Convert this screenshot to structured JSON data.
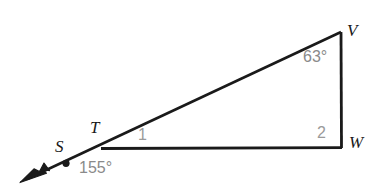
{
  "figure": {
    "type": "geometry-diagram",
    "background_color": "#ffffff",
    "stroke_color": "#1a1a1a",
    "label_color": "#191919",
    "angle_label_color": "#8a8a8a",
    "vertices": [
      {
        "name": "V",
        "label": "V",
        "x": 341,
        "y": 32
      },
      {
        "name": "W",
        "label": "W",
        "x": 341,
        "y": 147
      },
      {
        "name": "T",
        "label": "T",
        "x": 102,
        "y": 148
      },
      {
        "name": "S",
        "label": "S",
        "x": 66,
        "y": 163
      }
    ],
    "labels": {
      "v": "V",
      "w": "W",
      "t": "T",
      "s": "S"
    },
    "angles": [
      {
        "name": "angle-at-V",
        "label": "63°",
        "value": 63,
        "unit": "degrees",
        "at_vertex": "V"
      },
      {
        "name": "angle-1-at-T",
        "label": "1",
        "value": "1",
        "at_vertex": "T"
      },
      {
        "name": "angle-2-at-W",
        "label": "2",
        "value": "2",
        "at_vertex": "W"
      },
      {
        "name": "angle-at-S",
        "label": "155°",
        "value": 155,
        "unit": "degrees",
        "at_vertex": "S"
      }
    ],
    "angle_labels": {
      "at_v": "63°",
      "at_t": "1",
      "at_w": "2",
      "at_s": "155°"
    },
    "segments": [
      {
        "name": "segment-T-V",
        "from": "T",
        "to": "V"
      },
      {
        "name": "segment-V-W",
        "from": "V",
        "to": "W"
      },
      {
        "name": "segment-T-W",
        "from": "T",
        "to": "W"
      },
      {
        "name": "ray-T-S-arrow",
        "from": "T",
        "to": "arrowhead",
        "has_arrowhead": true
      }
    ]
  }
}
